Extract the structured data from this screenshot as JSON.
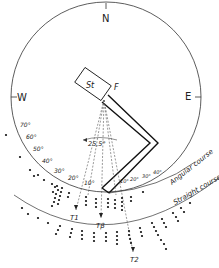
{
  "compass": {
    "north": "N",
    "east": "E",
    "west": "W"
  },
  "start_box": {
    "label": "St"
  },
  "feeder": {
    "label": "F"
  },
  "angle_label": "25,5°",
  "left_scale": [
    "70°",
    "60°",
    "50°",
    "40°",
    "30°",
    "20°",
    "10°"
  ],
  "right_scale": [
    "10°",
    "20°",
    "30°",
    "40°"
  ],
  "course_labels": {
    "angular": "Angular course",
    "straight": "Straight course"
  },
  "arrows": {
    "t1": "T1",
    "tb": "Tβ",
    "t2": "T2"
  },
  "colors": {
    "line": "#222222",
    "dashed": "#555555",
    "background": "#ffffff"
  }
}
